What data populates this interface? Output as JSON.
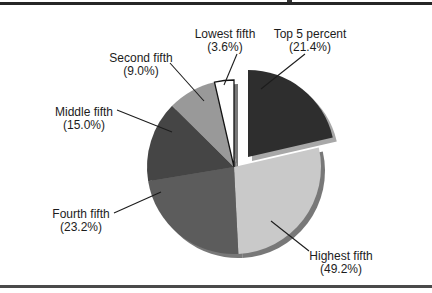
{
  "figure": {
    "background": "#ffffff",
    "top_rule_color": "#262626",
    "bottom_rule_color": "#4a4a4a"
  },
  "chart_data": {
    "type": "pie",
    "title": "",
    "legend_position": "none",
    "labels_style": "external callout labels, two lines each",
    "center": {
      "x": 234,
      "y": 167
    },
    "radius": 87,
    "start_angle": "12 o'clock",
    "direction": "clockwise",
    "text_color": "#1c1c1c",
    "callout_color": "#1c1c1c",
    "font_size": 12,
    "shadow": {
      "dx": 4,
      "dy": 4,
      "main_color": "#787878",
      "exploded_color": "#a8a8a8"
    },
    "slices": [
      {
        "name": "Top 5 percent",
        "display_value": "(21.4%)",
        "percent_display": 21.4,
        "wedge_percent": 21.4,
        "color": "#2e2e2e",
        "exploded": true,
        "explode_dx": 14,
        "explode_dy": -10,
        "label": {
          "x": 310,
          "y1": 38,
          "y2": 51
        },
        "callout": {
          "x1": 305,
          "y1": 54,
          "x2": 261,
          "y2": 89
        }
      },
      {
        "name": "Highest fifth",
        "display_value": "(49.2%)",
        "percent_display": 49.2,
        "wedge_percent": 27.8,
        "color": "#c9c9c9",
        "exploded": false,
        "label": {
          "x": 341,
          "y1": 260,
          "y2": 273
        },
        "callout": {
          "x1": 309,
          "y1": 251,
          "x2": 271,
          "y2": 221
        }
      },
      {
        "name": "Fourth fifth",
        "display_value": "(23.2%)",
        "percent_display": 23.2,
        "wedge_percent": 23.2,
        "color": "#5c5c5c",
        "exploded": false,
        "label": {
          "x": 81,
          "y1": 218,
          "y2": 231
        },
        "callout": {
          "x1": 114,
          "y1": 213,
          "x2": 161,
          "y2": 192
        }
      },
      {
        "name": "Middle fifth",
        "display_value": "(15.0%)",
        "percent_display": 15.0,
        "wedge_percent": 15.0,
        "color": "#454545",
        "exploded": false,
        "label": {
          "x": 84,
          "y1": 116,
          "y2": 129
        },
        "callout": {
          "x1": 117,
          "y1": 110,
          "x2": 172,
          "y2": 132
        }
      },
      {
        "name": "Second fifth",
        "display_value": "(9.0%)",
        "percent_display": 9.0,
        "wedge_percent": 9.0,
        "color": "#999999",
        "exploded": false,
        "label": {
          "x": 141,
          "y1": 62,
          "y2": 75
        },
        "callout": {
          "x1": 170,
          "y1": 63,
          "x2": 204,
          "y2": 101
        }
      },
      {
        "name": "Lowest fifth",
        "display_value": "(3.6%)",
        "percent_display": 3.6,
        "wedge_percent": 3.6,
        "color": "#ffffff",
        "stroke": "#141414",
        "stroke_width": 1.3,
        "exploded": false,
        "label": {
          "x": 225,
          "y1": 38,
          "y2": 51
        },
        "callout": {
          "x1": 237,
          "y1": 54,
          "x2": 224,
          "y2": 85
        }
      }
    ]
  }
}
